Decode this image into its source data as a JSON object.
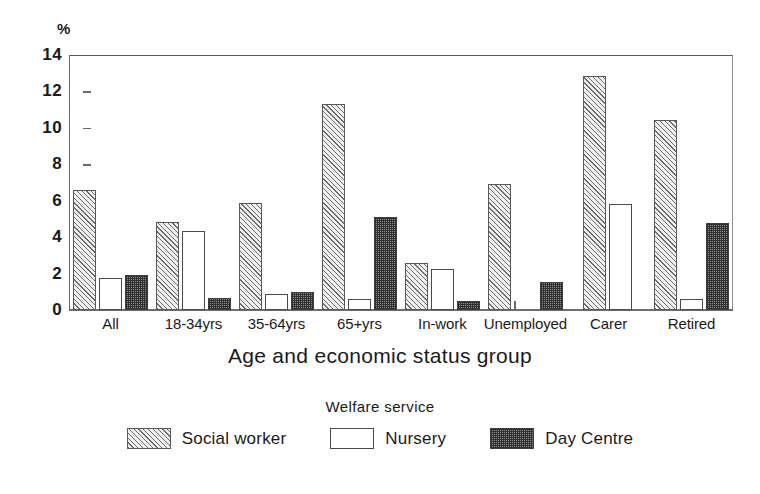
{
  "chart_data": {
    "type": "bar",
    "title": "",
    "xlabel": "Age and economic status group",
    "ylabel": "%",
    "ylim": [
      0,
      14
    ],
    "yticks": [
      0,
      2,
      4,
      6,
      8,
      10,
      12,
      14
    ],
    "grid": false,
    "legend_title": "Welfare service",
    "legend_position": "bottom",
    "categories": [
      "All",
      "18-34yrs",
      "35-64yrs",
      "65+yrs",
      "In-work",
      "Unemployed",
      "Carer",
      "Retired"
    ],
    "series": [
      {
        "name": "Social worker",
        "pattern": "diagonal-hatch",
        "values": [
          6.6,
          4.85,
          5.9,
          11.3,
          2.6,
          6.9,
          12.85,
          10.45
        ]
      },
      {
        "name": "Nursery",
        "pattern": "outline-white",
        "values": [
          1.75,
          4.35,
          0.9,
          0.6,
          2.25,
          0.1,
          5.8,
          0.6
        ]
      },
      {
        "name": "Day Centre",
        "pattern": "dark-stipple",
        "values": [
          1.9,
          0.65,
          1.0,
          5.1,
          0.5,
          1.55,
          0.0,
          4.75
        ]
      }
    ]
  },
  "axis": {
    "y_unit_label": "%",
    "x_axis_title": "Age and economic status group"
  },
  "legend": {
    "title": "Welfare service",
    "entries": [
      {
        "label": "Social worker",
        "swatch": "hatch-swatch"
      },
      {
        "label": "Nursery",
        "swatch": "white-swatch"
      },
      {
        "label": "Day Centre",
        "swatch": "stipple-swatch"
      }
    ]
  },
  "colors": {
    "axis": "#6a6a6a",
    "hatch_line": "#6e6e6e",
    "stipple_fill": "#8a8a8a",
    "text": "#1a1a1a",
    "background": "#ffffff"
  }
}
